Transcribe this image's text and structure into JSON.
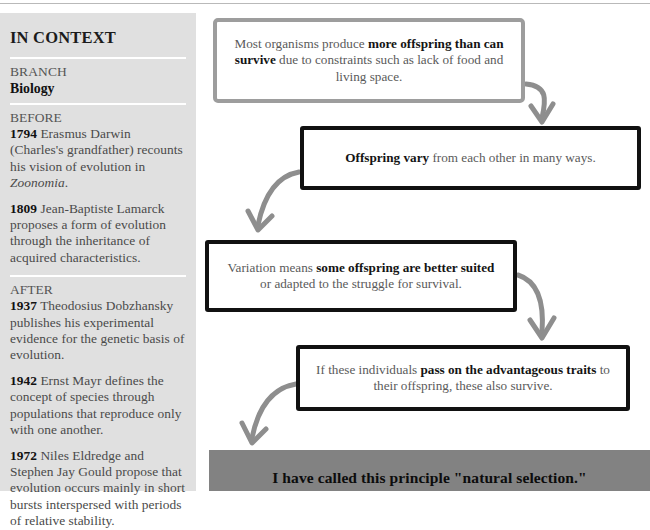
{
  "sidebar": {
    "title": "IN CONTEXT",
    "branch": {
      "label": "BRANCH",
      "value": "Biology"
    },
    "before": {
      "heading": "BEFORE",
      "entries": [
        {
          "year": "1794",
          "text_pre": " Erasmus Darwin (Charles's grandfather) recounts his vision of evolution in ",
          "italic": "Zoonomia",
          "text_post": "."
        },
        {
          "year": "1809",
          "text_pre": " Jean-Baptiste Lamarck proposes a form of evolution through the inheritance of acquired characteristics.",
          "italic": "",
          "text_post": ""
        }
      ]
    },
    "after": {
      "heading": "AFTER",
      "entries": [
        {
          "year": "1937",
          "text_pre": " Theodosius Dobzhansky publishes his experimental evidence for the genetic basis of evolution.",
          "italic": "",
          "text_post": ""
        },
        {
          "year": "1942",
          "text_pre": " Ernst Mayr defines the concept of species through populations that reproduce only with one another.",
          "italic": "",
          "text_post": ""
        },
        {
          "year": "1972",
          "text_pre": " Niles Eldredge and Stephen Jay Gould propose that evolution occurs mainly in short bursts interspersed with periods of relative stability.",
          "italic": "",
          "text_post": ""
        }
      ]
    }
  },
  "flow": {
    "boxes": [
      {
        "id": "box1",
        "border_color": "#9d9d9d",
        "segments": [
          {
            "text": "Most organisms produce ",
            "bold": false
          },
          {
            "text": "more offspring than can survive",
            "bold": true
          },
          {
            "text": " due to constraints such as lack of food and living space.",
            "bold": false
          }
        ]
      },
      {
        "id": "box2",
        "border_color": "#111111",
        "segments": [
          {
            "text": "Offspring vary",
            "bold": true
          },
          {
            "text": " from each other in many ways.",
            "bold": false
          }
        ]
      },
      {
        "id": "box3",
        "border_color": "#111111",
        "segments": [
          {
            "text": "Variation means ",
            "bold": false
          },
          {
            "text": "some offspring are better suited",
            "bold": true
          },
          {
            "text": " or adapted to the struggle for survival.",
            "bold": false
          }
        ]
      },
      {
        "id": "box4",
        "border_color": "#111111",
        "segments": [
          {
            "text": "If these individuals ",
            "bold": false
          },
          {
            "text": "pass on the advantageous traits",
            "bold": true
          },
          {
            "text": " to their offspring, these also survive.",
            "bold": false
          }
        ]
      }
    ],
    "arrow_color": "#8e8e8e",
    "arrow_count": 4
  },
  "banner": {
    "text": "I have called this principle \"natural selection.\"",
    "background": "#828282"
  }
}
